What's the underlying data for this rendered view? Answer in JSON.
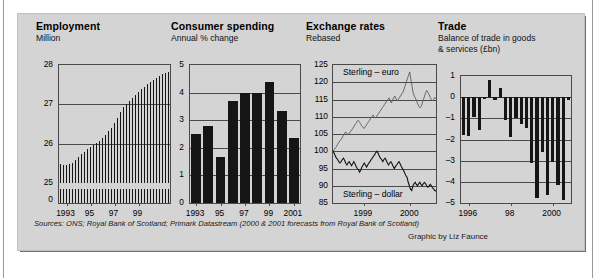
{
  "panel": {
    "background_color": "#d4d4d4",
    "sources_note": "Sources: ONS; Royal Bank of Scotland; Primark Datastream (2000 & 2001 forecasts from Royal Bank of Scotland)",
    "credit": "Graphic by Liz Faunce"
  },
  "chart_data": [
    {
      "type": "bar",
      "title": "Employment",
      "subtitle": "Million",
      "xlabel": "",
      "ylabel": "Million",
      "ylim": [
        25,
        28
      ],
      "yticks": [
        "0",
        "25",
        "26",
        "27",
        "28"
      ],
      "axis_break": true,
      "grid": true,
      "xticks": [
        "1993",
        "95",
        "97",
        "99"
      ],
      "categories": [
        "1992Q4",
        "1993Q1",
        "1993Q2",
        "1993Q3",
        "1993Q4",
        "1994Q1",
        "1994Q2",
        "1994Q3",
        "1994Q4",
        "1995Q1",
        "1995Q2",
        "1995Q3",
        "1995Q4",
        "1996Q1",
        "1996Q2",
        "1996Q3",
        "1996Q4",
        "1997Q1",
        "1997Q2",
        "1997Q3",
        "1997Q4",
        "1998Q1",
        "1998Q2",
        "1998Q3",
        "1998Q4",
        "1999Q1",
        "1999Q2",
        "1999Q3",
        "1999Q4",
        "2000Q1",
        "2000Q2",
        "2000Q3",
        "2000Q4",
        "2001Q1",
        "2001Q2",
        "2001Q3",
        "2001Q4"
      ],
      "values": [
        25.48,
        25.47,
        25.46,
        25.48,
        25.52,
        25.58,
        25.66,
        25.74,
        25.8,
        25.86,
        25.92,
        25.97,
        26.01,
        26.07,
        26.14,
        26.22,
        26.31,
        26.41,
        26.53,
        26.66,
        26.8,
        26.92,
        27.01,
        27.09,
        27.17,
        27.24,
        27.31,
        27.38,
        27.45,
        27.52,
        27.58,
        27.63,
        27.68,
        27.73,
        27.77,
        27.8,
        27.83
      ]
    },
    {
      "type": "bar",
      "title": "Consumer spending",
      "subtitle": "Annual % change",
      "xlabel": "",
      "ylabel": "Annual % change",
      "ylim": [
        0,
        5
      ],
      "yticks": [
        "0",
        "1",
        "2",
        "3",
        "4",
        "5"
      ],
      "grid": true,
      "categories": [
        "1993",
        "1994",
        "1995",
        "1996",
        "1997",
        "1998",
        "1999",
        "2000",
        "2001"
      ],
      "xticks": [
        "1993",
        "95",
        "97",
        "99",
        "2001"
      ],
      "values": [
        2.5,
        2.8,
        1.65,
        3.7,
        4.0,
        4.0,
        4.4,
        3.35,
        2.35
      ]
    },
    {
      "type": "line",
      "title": "Exchange rates",
      "subtitle": "Rebased",
      "xlabel": "",
      "ylabel": "Rebased",
      "ylim": [
        85,
        125
      ],
      "yticks": [
        "85",
        "90",
        "95",
        "100",
        "105",
        "110",
        "115",
        "120",
        "125"
      ],
      "xticks": [
        "1999",
        "2000"
      ],
      "grid": true,
      "annotations": [
        "Sterling – euro",
        "Sterling – dollar"
      ],
      "series": [
        {
          "name": "Sterling – euro",
          "values": [
            100,
            100.4,
            101,
            101.3,
            102,
            102.6,
            103,
            103.4,
            104,
            104.5,
            105,
            105.6,
            105.2,
            104.8,
            105.1,
            105.6,
            106,
            106.5,
            107,
            107.6,
            108,
            108.6,
            109,
            108.5,
            108,
            107.4,
            107,
            106.6,
            107,
            107.5,
            108,
            108.6,
            109,
            109.6,
            110,
            110.5,
            110,
            109.6,
            110,
            110.6,
            111,
            111.6,
            112,
            112.6,
            113,
            113.6,
            114,
            114.6,
            115,
            115.5,
            114.6,
            114,
            114.8,
            115.5,
            116,
            115.3,
            114.6,
            115,
            115.6,
            116,
            116.6,
            117,
            118,
            119,
            120,
            121,
            122,
            123,
            121,
            119,
            117,
            116,
            115.4,
            114.6,
            113.8,
            113,
            112.6,
            113,
            114,
            115,
            116,
            117,
            117.6,
            117,
            116.4,
            115.6,
            115,
            114.6,
            115,
            115.6,
            115.2
          ]
        },
        {
          "name": "Sterling – dollar",
          "values": [
            100,
            99.4,
            98.6,
            98,
            97.6,
            97,
            96.6,
            97,
            97.6,
            98,
            97.4,
            96.6,
            96,
            96.6,
            97,
            96.4,
            95.8,
            96.4,
            97,
            96.4,
            95.6,
            95,
            94.6,
            94,
            94.6,
            95.4,
            96,
            96.6,
            96,
            95.4,
            96,
            96.6,
            97,
            97.6,
            98,
            98.6,
            99,
            99.6,
            100,
            99.4,
            98.6,
            98,
            97.6,
            97,
            97.6,
            98,
            97.4,
            96.6,
            96,
            96.6,
            97,
            96.4,
            95.6,
            95,
            95.6,
            96,
            96.6,
            97,
            96.4,
            95.6,
            95,
            94.4,
            93.6,
            93,
            92.4,
            91,
            90,
            89,
            88.6,
            90,
            90.6,
            91,
            90.4,
            90,
            90.6,
            91,
            90.4,
            90,
            90.6,
            91,
            90.6,
            90,
            89.6,
            90,
            90.4,
            90,
            89.4,
            89,
            88.6,
            88.4
          ]
        }
      ]
    },
    {
      "type": "bar",
      "title": "Trade",
      "subtitle": "Balance of trade in goods & services (£bn)",
      "xlabel": "",
      "ylabel": "£bn",
      "ylim": [
        -5,
        1
      ],
      "yticks": [
        "1",
        "0",
        "–1",
        "–2",
        "–3",
        "–4",
        "–5"
      ],
      "grid": true,
      "xticks": [
        "1996",
        "98",
        "2000"
      ],
      "categories": [
        "1995Q4",
        "1996Q1",
        "1996Q2",
        "1996Q3",
        "1996Q4",
        "1997Q1",
        "1997Q2",
        "1997Q3",
        "1997Q4",
        "1998Q1",
        "1998Q2",
        "1998Q3",
        "1998Q4",
        "1999Q1",
        "1999Q2",
        "1999Q3",
        "1999Q4",
        "2000Q1",
        "2000Q2",
        "2000Q3",
        "2000Q4"
      ],
      "values": [
        -1.8,
        -1.85,
        -0.95,
        -1.55,
        -0.1,
        0.8,
        -0.15,
        0.45,
        -1.1,
        -1.9,
        -1.0,
        -1.25,
        -1.45,
        -3.1,
        -4.75,
        -2.6,
        -4.6,
        -3.05,
        -4.15,
        -4.85,
        -0.15
      ]
    }
  ]
}
